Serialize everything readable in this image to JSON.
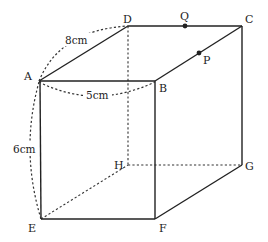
{
  "figure": {
    "type": "rectangular prism (cuboid) diagram",
    "vertices": {
      "A": "A",
      "B": "B",
      "C": "C",
      "D": "D",
      "E": "E",
      "F": "F",
      "G": "G",
      "H": "H"
    },
    "points": {
      "P": "P",
      "Q": "Q"
    },
    "dimensions": {
      "AD": "8cm",
      "AB": "5cm",
      "AE": "6cm"
    }
  }
}
